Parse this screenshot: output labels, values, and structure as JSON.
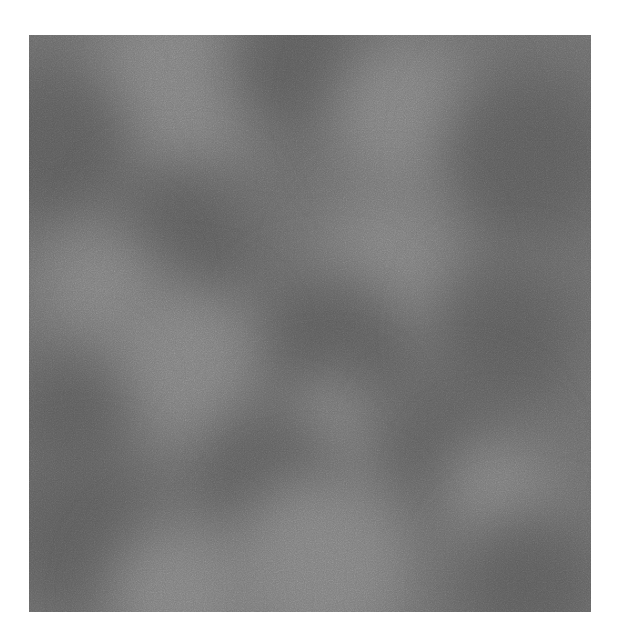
{
  "canvas": {
    "width": 618,
    "height": 643,
    "background": "#ffffff"
  },
  "texture": {
    "description": "Grayscale cloud-like noise texture (smooth blobs with fine grain)",
    "left": 29,
    "top": 35,
    "width": 562,
    "height": 577,
    "base_color": "#6c6c6c",
    "light_color": "#7f7f7f",
    "dark_color": "#5c5c5c",
    "blobs": [
      {
        "x": 150,
        "y": 50,
        "r": 90,
        "tone": "light"
      },
      {
        "x": 20,
        "y": 110,
        "r": 80,
        "tone": "dark"
      },
      {
        "x": 270,
        "y": 30,
        "r": 70,
        "tone": "dark"
      },
      {
        "x": 380,
        "y": 80,
        "r": 75,
        "tone": "light"
      },
      {
        "x": 500,
        "y": 120,
        "r": 85,
        "tone": "dark"
      },
      {
        "x": 150,
        "y": 210,
        "r": 75,
        "tone": "dark"
      },
      {
        "x": 70,
        "y": 250,
        "r": 60,
        "tone": "light"
      },
      {
        "x": 360,
        "y": 230,
        "r": 70,
        "tone": "light"
      },
      {
        "x": 300,
        "y": 320,
        "r": 80,
        "tone": "dark"
      },
      {
        "x": 480,
        "y": 300,
        "r": 70,
        "tone": "dark"
      },
      {
        "x": 150,
        "y": 330,
        "r": 80,
        "tone": "light"
      },
      {
        "x": 40,
        "y": 380,
        "r": 60,
        "tone": "dark"
      },
      {
        "x": 300,
        "y": 390,
        "r": 50,
        "tone": "light"
      },
      {
        "x": 240,
        "y": 450,
        "r": 70,
        "tone": "dark"
      },
      {
        "x": 430,
        "y": 420,
        "r": 70,
        "tone": "dark"
      },
      {
        "x": 470,
        "y": 460,
        "r": 60,
        "tone": "light"
      },
      {
        "x": 50,
        "y": 500,
        "r": 80,
        "tone": "dark"
      },
      {
        "x": 290,
        "y": 530,
        "r": 90,
        "tone": "light"
      },
      {
        "x": 500,
        "y": 550,
        "r": 70,
        "tone": "dark"
      },
      {
        "x": 150,
        "y": 560,
        "r": 70,
        "tone": "light"
      }
    ]
  }
}
